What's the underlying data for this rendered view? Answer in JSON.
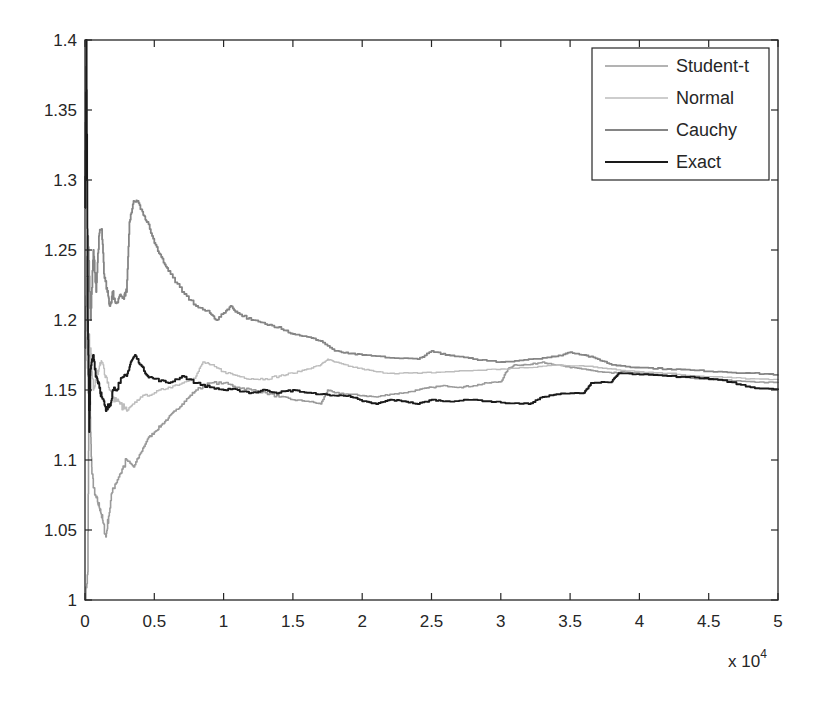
{
  "chart_data": {
    "type": "line",
    "title": "",
    "xlabel": "",
    "ylabel": "",
    "x_multiplier_label": "x 10",
    "x_multiplier_exponent": "4",
    "xlim": [
      0,
      5
    ],
    "ylim": [
      1,
      1.4
    ],
    "grid": false,
    "legend_position": "upper right",
    "xticks": [
      0,
      0.5,
      1,
      1.5,
      2,
      2.5,
      3,
      3.5,
      4,
      4.5,
      5
    ],
    "xtick_labels": [
      "0",
      "0.5",
      "1",
      "1.5",
      "2",
      "2.5",
      "3",
      "3.5",
      "4",
      "4.5",
      "5"
    ],
    "yticks": [
      1,
      1.05,
      1.1,
      1.15,
      1.2,
      1.25,
      1.3,
      1.35,
      1.4
    ],
    "ytick_labels": [
      "1",
      "1.05",
      "1.1",
      "1.15",
      "1.2",
      "1.25",
      "1.3",
      "1.35",
      "1.4"
    ],
    "series": [
      {
        "name": "Student-t",
        "color": "#9a9a9a",
        "width": 1.6,
        "points": [
          [
            0,
            1.0
          ],
          [
            0.02,
            1.02
          ],
          [
            0.03,
            1.19
          ],
          [
            0.04,
            1.12
          ],
          [
            0.05,
            1.09
          ],
          [
            0.07,
            1.075
          ],
          [
            0.09,
            1.07
          ],
          [
            0.11,
            1.065
          ],
          [
            0.13,
            1.055
          ],
          [
            0.15,
            1.045
          ],
          [
            0.17,
            1.06
          ],
          [
            0.2,
            1.08
          ],
          [
            0.25,
            1.09
          ],
          [
            0.3,
            1.1
          ],
          [
            0.35,
            1.095
          ],
          [
            0.4,
            1.105
          ],
          [
            0.45,
            1.115
          ],
          [
            0.5,
            1.12
          ],
          [
            0.55,
            1.125
          ],
          [
            0.6,
            1.13
          ],
          [
            0.65,
            1.135
          ],
          [
            0.7,
            1.14
          ],
          [
            0.75,
            1.145
          ],
          [
            0.8,
            1.15
          ],
          [
            0.9,
            1.155
          ],
          [
            1.0,
            1.155
          ],
          [
            1.1,
            1.152
          ],
          [
            1.2,
            1.15
          ],
          [
            1.3,
            1.148
          ],
          [
            1.4,
            1.145
          ],
          [
            1.5,
            1.143
          ],
          [
            1.6,
            1.142
          ],
          [
            1.7,
            1.14
          ],
          [
            1.75,
            1.15
          ],
          [
            1.8,
            1.148
          ],
          [
            1.9,
            1.147
          ],
          [
            2.0,
            1.146
          ],
          [
            2.1,
            1.145
          ],
          [
            2.2,
            1.147
          ],
          [
            2.3,
            1.148
          ],
          [
            2.4,
            1.15
          ],
          [
            2.5,
            1.152
          ],
          [
            2.6,
            1.153
          ],
          [
            2.7,
            1.152
          ],
          [
            2.8,
            1.153
          ],
          [
            2.9,
            1.155
          ],
          [
            3.0,
            1.156
          ],
          [
            3.05,
            1.165
          ],
          [
            3.1,
            1.168
          ],
          [
            3.2,
            1.168
          ],
          [
            3.3,
            1.17
          ],
          [
            3.4,
            1.168
          ],
          [
            3.5,
            1.166
          ],
          [
            3.6,
            1.165
          ],
          [
            3.7,
            1.163
          ],
          [
            3.8,
            1.162
          ],
          [
            3.9,
            1.163
          ],
          [
            4.0,
            1.162
          ],
          [
            4.2,
            1.16
          ],
          [
            4.4,
            1.158
          ],
          [
            4.6,
            1.157
          ],
          [
            4.8,
            1.156
          ],
          [
            5.0,
            1.155
          ]
        ]
      },
      {
        "name": "Normal",
        "color": "#bdbdbd",
        "width": 1.4,
        "points": [
          [
            0,
            1.2
          ],
          [
            0.02,
            1.16
          ],
          [
            0.04,
            1.18
          ],
          [
            0.06,
            1.15
          ],
          [
            0.08,
            1.16
          ],
          [
            0.1,
            1.165
          ],
          [
            0.12,
            1.17
          ],
          [
            0.15,
            1.16
          ],
          [
            0.18,
            1.15
          ],
          [
            0.2,
            1.145
          ],
          [
            0.25,
            1.14
          ],
          [
            0.3,
            1.135
          ],
          [
            0.35,
            1.14
          ],
          [
            0.4,
            1.145
          ],
          [
            0.5,
            1.148
          ],
          [
            0.6,
            1.152
          ],
          [
            0.7,
            1.155
          ],
          [
            0.8,
            1.16
          ],
          [
            0.85,
            1.17
          ],
          [
            0.9,
            1.168
          ],
          [
            1.0,
            1.163
          ],
          [
            1.1,
            1.16
          ],
          [
            1.2,
            1.158
          ],
          [
            1.3,
            1.158
          ],
          [
            1.4,
            1.16
          ],
          [
            1.5,
            1.162
          ],
          [
            1.6,
            1.165
          ],
          [
            1.7,
            1.168
          ],
          [
            1.75,
            1.172
          ],
          [
            1.8,
            1.17
          ],
          [
            1.9,
            1.167
          ],
          [
            2.0,
            1.165
          ],
          [
            2.1,
            1.163
          ],
          [
            2.2,
            1.162
          ],
          [
            2.4,
            1.162
          ],
          [
            2.6,
            1.163
          ],
          [
            2.8,
            1.164
          ],
          [
            3.0,
            1.165
          ],
          [
            3.2,
            1.166
          ],
          [
            3.4,
            1.168
          ],
          [
            3.6,
            1.167
          ],
          [
            3.8,
            1.165
          ],
          [
            4.0,
            1.163
          ],
          [
            4.2,
            1.162
          ],
          [
            4.4,
            1.16
          ],
          [
            4.6,
            1.159
          ],
          [
            4.8,
            1.158
          ],
          [
            5.0,
            1.157
          ]
        ]
      },
      {
        "name": "Cauchy",
        "color": "#858585",
        "width": 1.8,
        "points": [
          [
            0,
            1.18
          ],
          [
            0.02,
            1.26
          ],
          [
            0.04,
            1.2
          ],
          [
            0.06,
            1.25
          ],
          [
            0.08,
            1.22
          ],
          [
            0.1,
            1.26
          ],
          [
            0.12,
            1.265
          ],
          [
            0.14,
            1.23
          ],
          [
            0.16,
            1.22
          ],
          [
            0.18,
            1.21
          ],
          [
            0.2,
            1.22
          ],
          [
            0.22,
            1.212
          ],
          [
            0.25,
            1.218
          ],
          [
            0.28,
            1.215
          ],
          [
            0.3,
            1.22
          ],
          [
            0.32,
            1.27
          ],
          [
            0.35,
            1.285
          ],
          [
            0.38,
            1.285
          ],
          [
            0.42,
            1.275
          ],
          [
            0.45,
            1.27
          ],
          [
            0.5,
            1.255
          ],
          [
            0.55,
            1.245
          ],
          [
            0.6,
            1.235
          ],
          [
            0.7,
            1.22
          ],
          [
            0.8,
            1.21
          ],
          [
            0.9,
            1.205
          ],
          [
            0.95,
            1.2
          ],
          [
            1.0,
            1.205
          ],
          [
            1.05,
            1.21
          ],
          [
            1.1,
            1.205
          ],
          [
            1.2,
            1.2
          ],
          [
            1.3,
            1.197
          ],
          [
            1.4,
            1.195
          ],
          [
            1.5,
            1.19
          ],
          [
            1.6,
            1.188
          ],
          [
            1.7,
            1.185
          ],
          [
            1.8,
            1.178
          ],
          [
            1.9,
            1.176
          ],
          [
            2.0,
            1.175
          ],
          [
            2.2,
            1.173
          ],
          [
            2.4,
            1.172
          ],
          [
            2.5,
            1.178
          ],
          [
            2.6,
            1.175
          ],
          [
            2.8,
            1.172
          ],
          [
            3.0,
            1.17
          ],
          [
            3.2,
            1.172
          ],
          [
            3.4,
            1.174
          ],
          [
            3.5,
            1.177
          ],
          [
            3.6,
            1.175
          ],
          [
            3.7,
            1.172
          ],
          [
            3.8,
            1.168
          ],
          [
            4.0,
            1.166
          ],
          [
            4.2,
            1.165
          ],
          [
            4.4,
            1.164
          ],
          [
            4.6,
            1.163
          ],
          [
            4.8,
            1.162
          ],
          [
            5.0,
            1.161
          ]
        ]
      },
      {
        "name": "Exact",
        "color": "#1a1a1a",
        "width": 1.9,
        "points": [
          [
            0,
            1.28
          ],
          [
            0.01,
            1.4
          ],
          [
            0.02,
            1.2
          ],
          [
            0.03,
            1.12
          ],
          [
            0.04,
            1.165
          ],
          [
            0.06,
            1.175
          ],
          [
            0.08,
            1.16
          ],
          [
            0.1,
            1.155
          ],
          [
            0.12,
            1.145
          ],
          [
            0.15,
            1.135
          ],
          [
            0.18,
            1.14
          ],
          [
            0.2,
            1.15
          ],
          [
            0.25,
            1.155
          ],
          [
            0.3,
            1.16
          ],
          [
            0.33,
            1.17
          ],
          [
            0.36,
            1.175
          ],
          [
            0.4,
            1.168
          ],
          [
            0.45,
            1.16
          ],
          [
            0.5,
            1.158
          ],
          [
            0.6,
            1.155
          ],
          [
            0.7,
            1.16
          ],
          [
            0.8,
            1.155
          ],
          [
            0.9,
            1.152
          ],
          [
            1.0,
            1.15
          ],
          [
            1.1,
            1.15
          ],
          [
            1.2,
            1.148
          ],
          [
            1.3,
            1.15
          ],
          [
            1.4,
            1.148
          ],
          [
            1.5,
            1.15
          ],
          [
            1.6,
            1.148
          ],
          [
            1.7,
            1.147
          ],
          [
            1.8,
            1.146
          ],
          [
            1.9,
            1.146
          ],
          [
            2.0,
            1.142
          ],
          [
            2.1,
            1.14
          ],
          [
            2.2,
            1.143
          ],
          [
            2.3,
            1.142
          ],
          [
            2.4,
            1.14
          ],
          [
            2.5,
            1.143
          ],
          [
            2.6,
            1.142
          ],
          [
            2.8,
            1.143
          ],
          [
            3.0,
            1.141
          ],
          [
            3.2,
            1.14
          ],
          [
            3.3,
            1.145
          ],
          [
            3.4,
            1.147
          ],
          [
            3.6,
            1.148
          ],
          [
            3.65,
            1.155
          ],
          [
            3.8,
            1.156
          ],
          [
            3.85,
            1.162
          ],
          [
            4.0,
            1.161
          ],
          [
            4.2,
            1.16
          ],
          [
            4.4,
            1.159
          ],
          [
            4.6,
            1.157
          ],
          [
            4.8,
            1.152
          ],
          [
            5.0,
            1.15
          ]
        ]
      }
    ]
  }
}
